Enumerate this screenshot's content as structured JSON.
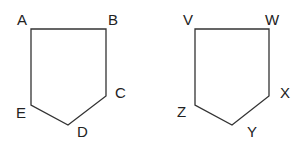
{
  "diagram": {
    "stroke_color": "#333333",
    "label_color": "#222222",
    "pentagons": [
      {
        "name": "ABCDE",
        "vertices": [
          {
            "label": "A",
            "x": 31,
            "y": 29,
            "lx": 17,
            "ly": 25
          },
          {
            "label": "B",
            "x": 106,
            "y": 29,
            "lx": 108,
            "ly": 25
          },
          {
            "label": "C",
            "x": 106,
            "y": 96,
            "lx": 115,
            "ly": 98
          },
          {
            "label": "D",
            "x": 68,
            "y": 125,
            "lx": 77,
            "ly": 137
          },
          {
            "label": "E",
            "x": 31,
            "y": 105,
            "lx": 16,
            "ly": 118
          }
        ]
      },
      {
        "name": "VWXYZ",
        "vertices": [
          {
            "label": "V",
            "x": 195,
            "y": 29,
            "lx": 183,
            "ly": 25
          },
          {
            "label": "W",
            "x": 269,
            "y": 29,
            "lx": 265,
            "ly": 25
          },
          {
            "label": "X",
            "x": 269,
            "y": 96,
            "lx": 280,
            "ly": 98
          },
          {
            "label": "Y",
            "x": 232,
            "y": 125,
            "lx": 247,
            "ly": 137
          },
          {
            "label": "Z",
            "x": 195,
            "y": 105,
            "lx": 177,
            "ly": 117
          }
        ]
      }
    ]
  }
}
